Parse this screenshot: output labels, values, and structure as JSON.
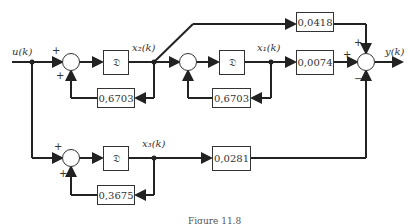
{
  "diagram": {
    "signals": {
      "input": "u(k)",
      "output": "y(k)",
      "x1": "x₁(k)",
      "x2": "x₂(k)",
      "x3": "x₃(k)"
    },
    "blocks": {
      "delay_symbol": "𝔇",
      "fb1_gain": "0,6703",
      "fb2_gain": "0,6703",
      "fb3_gain": "0,3675",
      "ff_gain": "0,0418",
      "x1_gain": "0,0074",
      "x3_gain": "0,0281"
    },
    "signs": {
      "plus": "+",
      "minus": "−"
    },
    "caption": "Figure 11.8"
  }
}
